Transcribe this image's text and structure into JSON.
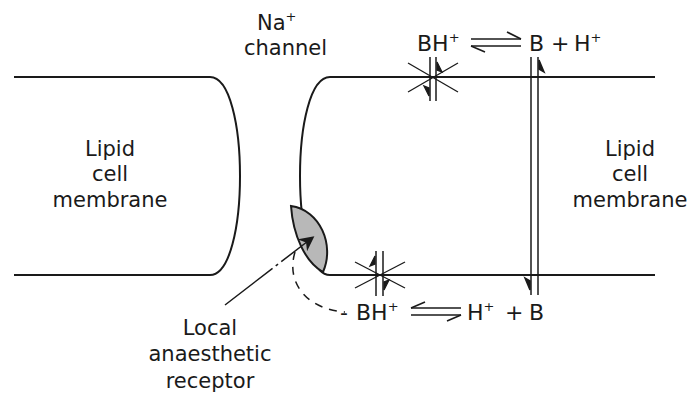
{
  "diagram": {
    "labels": {
      "channel_ion": "Na",
      "channel_ion_charge": "+",
      "channel_word": "channel",
      "left_membrane": [
        "Lipid",
        "cell",
        "membrane"
      ],
      "right_membrane": [
        "Lipid",
        "cell",
        "membrane"
      ],
      "receptor": [
        "Local",
        "anaesthetic",
        "receptor"
      ]
    },
    "equilibria": {
      "top": {
        "left": "BH",
        "left_charge": "+",
        "right_b": "B",
        "plus": "+",
        "right_h": "H",
        "right_h_charge": "+"
      },
      "bottom": {
        "dash": "-",
        "left": "BH",
        "left_charge": "+",
        "right_h": "H",
        "right_h_charge": "+",
        "plus": "+",
        "right_b": "B"
      }
    },
    "colors": {
      "line": "#1a1a1a",
      "receptor_fill": "#b8b8b8",
      "background": "#ffffff"
    }
  }
}
